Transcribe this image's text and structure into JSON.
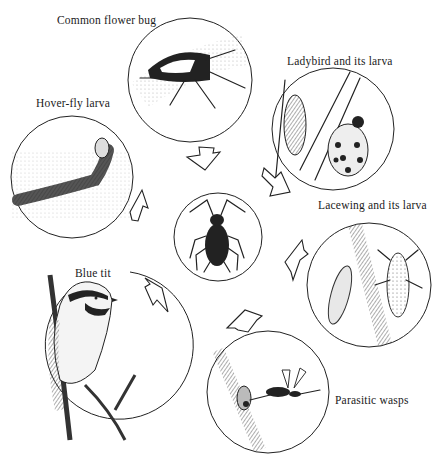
{
  "diagram": {
    "title": "",
    "center": {
      "name": "Aphid",
      "label": ""
    },
    "predators": [
      {
        "id": "flower-bug",
        "label": "Common flower bug"
      },
      {
        "id": "ladybird",
        "label": "Ladybird and its larva"
      },
      {
        "id": "hoverfly",
        "label": "Hover-fly larva"
      },
      {
        "id": "lacewing",
        "label": "Lacewing and its larva"
      },
      {
        "id": "blue-tit",
        "label": "Blue tit"
      },
      {
        "id": "wasps",
        "label": "Parasitic wasps"
      }
    ],
    "arrows_point_to": "center",
    "colors": {
      "ink": "#222222",
      "background": "#ffffff"
    }
  }
}
